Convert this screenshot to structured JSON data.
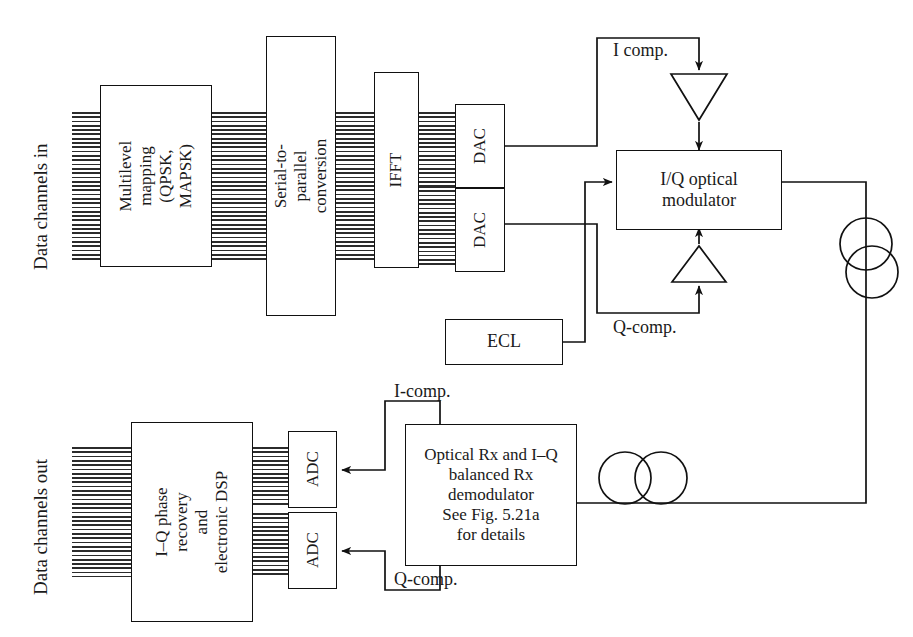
{
  "diagram": {
    "type": "block-diagram",
    "line_color": "#111111",
    "background": "#ffffff"
  },
  "labels": {
    "data_in": "Data channels in",
    "data_out": "Data channels out",
    "i_comp_tx": "I comp.",
    "q_comp_tx": "Q-comp.",
    "i_comp_rx": "I-comp.",
    "q_comp_rx": "Q-comp."
  },
  "transmitter": {
    "blocks": [
      {
        "id": "mapping",
        "label": "Multilevel\nmapping\n(QPSK, MAPSK)"
      },
      {
        "id": "s2p",
        "label": "Serial-to-parallel\nconversion"
      },
      {
        "id": "ifft",
        "label": "IFFT"
      },
      {
        "id": "dac1",
        "label": "DAC"
      },
      {
        "id": "dac2",
        "label": "DAC"
      },
      {
        "id": "modulator",
        "label": "I/Q optical\nmodulator"
      },
      {
        "id": "ecl",
        "label": "ECL"
      }
    ],
    "amplifiers": [
      {
        "id": "amp-i",
        "orientation": "down"
      },
      {
        "id": "amp-q",
        "orientation": "up"
      }
    ]
  },
  "receiver": {
    "blocks": [
      {
        "id": "dsp",
        "label": "I–Q phase recovery\nand\nelectronic DSP"
      },
      {
        "id": "adc1",
        "label": "ADC"
      },
      {
        "id": "adc2",
        "label": "ADC"
      },
      {
        "id": "optical_rx",
        "label": "Optical Rx and I–Q\nbalanced Rx\ndemodulator\nSee Fig. 5.21a\nfor details"
      }
    ]
  },
  "fiber_spools": [
    {
      "id": "spool-tx",
      "orientation": "vertical"
    },
    {
      "id": "spool-rx",
      "orientation": "horizontal"
    }
  ]
}
